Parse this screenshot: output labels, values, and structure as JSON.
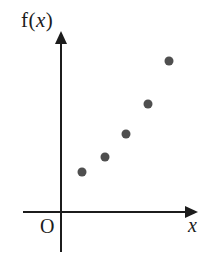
{
  "figure": {
    "background": "#ffffff",
    "axis_color": "#1c1c1c",
    "dot_color": "#4f4f4f",
    "ylabel_prefix": "f(",
    "ylabel_variable": "x",
    "ylabel_suffix": ")",
    "xlabel": "x",
    "origin_label": "O"
  },
  "chart_data": {
    "type": "scatter",
    "title": "",
    "xlabel": "x",
    "ylabel": "f(x)",
    "origin_label": "O",
    "legend": null,
    "grid": false,
    "axes_have_tick_labels": false,
    "trend": "increasing, convex (values rise faster at larger x)",
    "x": [
      1,
      2,
      3,
      4,
      5
    ],
    "y": [
      2.2,
      3.1,
      4.4,
      6.0,
      8.4
    ],
    "points_norm": [
      {
        "x": 0.154,
        "y": 0.223
      },
      {
        "x": 0.324,
        "y": 0.307
      },
      {
        "x": 0.478,
        "y": 0.436
      },
      {
        "x": 0.64,
        "y": 0.604
      },
      {
        "x": 0.796,
        "y": 0.844
      }
    ]
  }
}
